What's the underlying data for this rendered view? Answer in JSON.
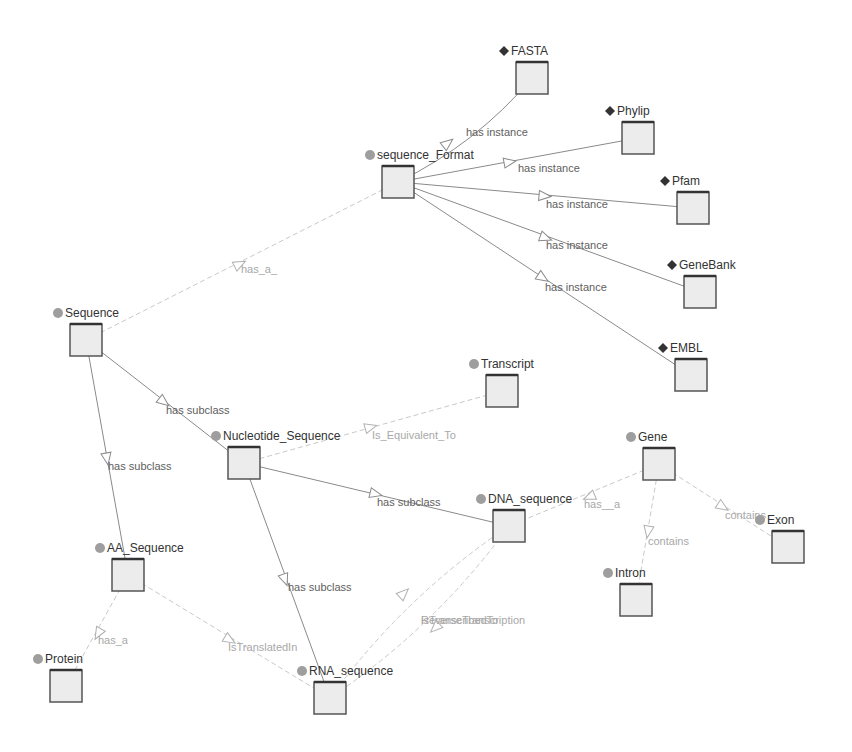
{
  "diagram": {
    "colors": {
      "background": "#ffffff",
      "node_fill": "#ececec",
      "node_border": "#555555",
      "class_marker": "#9e9e9e",
      "instance_marker": "#333333",
      "solid_edge": "#8a8a8a",
      "dashed_edge": "#c9c9c9"
    },
    "nodes": [
      {
        "id": "fasta",
        "label": "FASTA",
        "kind": "instance",
        "x": 532,
        "y": 78
      },
      {
        "id": "sequence_format",
        "label": "sequence_Format",
        "kind": "class",
        "x": 398,
        "y": 182
      },
      {
        "id": "phylip",
        "label": "Phylip",
        "kind": "instance",
        "x": 638,
        "y": 138
      },
      {
        "id": "pfam",
        "label": "Pfam",
        "kind": "instance",
        "x": 693,
        "y": 208
      },
      {
        "id": "genebank",
        "label": "GeneBank",
        "kind": "instance",
        "x": 700,
        "y": 292
      },
      {
        "id": "embl",
        "label": "EMBL",
        "kind": "instance",
        "x": 691,
        "y": 375
      },
      {
        "id": "sequence",
        "label": "Sequence",
        "kind": "class",
        "x": 86,
        "y": 340
      },
      {
        "id": "transcript",
        "label": "Transcript",
        "kind": "class",
        "x": 502,
        "y": 391
      },
      {
        "id": "nucleotide_sequence",
        "label": "Nucleotide_Sequence",
        "kind": "class",
        "x": 244,
        "y": 463
      },
      {
        "id": "gene",
        "label": "Gene",
        "kind": "class",
        "x": 659,
        "y": 464
      },
      {
        "id": "dna_sequence",
        "label": "DNA_sequence",
        "kind": "class",
        "x": 509,
        "y": 526
      },
      {
        "id": "exon",
        "label": "Exon",
        "kind": "class",
        "x": 788,
        "y": 547
      },
      {
        "id": "intron",
        "label": "Intron",
        "kind": "class",
        "x": 636,
        "y": 600
      },
      {
        "id": "aa_sequence",
        "label": "AA_Sequence",
        "kind": "class",
        "x": 128,
        "y": 575
      },
      {
        "id": "protein",
        "label": "Protein",
        "kind": "class",
        "x": 66,
        "y": 686
      },
      {
        "id": "rna_sequence",
        "label": "RNA_sequence",
        "kind": "class",
        "x": 330,
        "y": 698
      }
    ],
    "edges": [
      {
        "from": "sequence_format",
        "to": "fasta",
        "label": "has instance",
        "style": "solid",
        "curve": 18,
        "lx": 466,
        "ly": 136,
        "ax": 448,
        "ay": 143
      },
      {
        "from": "sequence_format",
        "to": "phylip",
        "label": "has instance",
        "style": "solid",
        "curve": 0,
        "lx": 518,
        "ly": 172,
        "ax": 510,
        "ay": 162
      },
      {
        "from": "sequence_format",
        "to": "pfam",
        "label": "has instance",
        "style": "solid",
        "curve": 0,
        "lx": 546,
        "ly": 208,
        "ax": 545,
        "ay": 196
      },
      {
        "from": "sequence_format",
        "to": "genebank",
        "label": "has instance",
        "style": "solid",
        "curve": 0,
        "lx": 546,
        "ly": 249,
        "ax": 546,
        "ay": 238
      },
      {
        "from": "sequence_format",
        "to": "embl",
        "label": "has instance",
        "style": "solid",
        "curve": 0,
        "lx": 545,
        "ly": 291,
        "ax": 543,
        "ay": 278
      },
      {
        "from": "sequence",
        "to": "sequence_format",
        "label": "has_a_",
        "style": "dashed",
        "curve": 0,
        "lx": 241,
        "ly": 273,
        "ax": 240,
        "ay": 264
      },
      {
        "from": "sequence",
        "to": "nucleotide_sequence",
        "label": "has subclass",
        "style": "solid",
        "curve": 0,
        "lx": 166,
        "ly": 414,
        "ax": 164,
        "ay": 402
      },
      {
        "from": "sequence",
        "to": "aa_sequence",
        "label": "has subclass",
        "style": "solid",
        "curve": 0,
        "lx": 108,
        "ly": 470,
        "ax": 107,
        "ay": 459
      },
      {
        "from": "nucleotide_sequence",
        "to": "transcript",
        "label": "Is_Equivalent_To",
        "style": "dashed",
        "curve": 0,
        "lx": 372,
        "ly": 439,
        "ax": 371,
        "ay": 427
      },
      {
        "from": "nucleotide_sequence",
        "to": "dna_sequence",
        "label": "has subclass",
        "style": "solid",
        "curve": 0,
        "lx": 377,
        "ly": 506,
        "ax": 376,
        "ay": 494
      },
      {
        "from": "nucleotide_sequence",
        "to": "rna_sequence",
        "label": "has subclass",
        "style": "solid",
        "curve": 0,
        "lx": 288,
        "ly": 591,
        "ax": 285,
        "ay": 580
      },
      {
        "from": "gene",
        "to": "dna_sequence",
        "label": "has__a",
        "style": "dashed",
        "curve": 0,
        "lx": 584,
        "ly": 508,
        "ax": 589,
        "ay": 497
      },
      {
        "from": "gene",
        "to": "intron",
        "label": "contains",
        "style": "dashed",
        "curve": 0,
        "lx": 648,
        "ly": 545,
        "ax": 648,
        "ay": 532
      },
      {
        "from": "gene",
        "to": "exon",
        "label": "contains",
        "style": "dashed",
        "curve": 0,
        "lx": 725,
        "ly": 519,
        "ax": 723,
        "ay": 507
      },
      {
        "from": "aa_sequence",
        "to": "protein",
        "label": "has_a",
        "style": "dashed",
        "curve": 0,
        "lx": 98,
        "ly": 644,
        "ax": 98,
        "ay": 634
      },
      {
        "from": "aa_sequence",
        "to": "rna_sequence",
        "label": "IsTranslatedIn",
        "style": "dashed",
        "curve": 0,
        "lx": 228,
        "ly": 651,
        "ax": 230,
        "ay": 640
      },
      {
        "from": "rna_sequence",
        "to": "dna_sequence",
        "label": "isTranscribedTo",
        "style": "dashed",
        "curve": -22,
        "lx": 421,
        "ly": 624,
        "ax": 404,
        "ay": 593
      },
      {
        "from": "dna_sequence",
        "to": "rna_sequence",
        "label": "ReverseTranscription",
        "style": "dashed",
        "curve": -22,
        "lx": 421,
        "ly": 624,
        "ax": 435,
        "ay": 628
      }
    ]
  }
}
